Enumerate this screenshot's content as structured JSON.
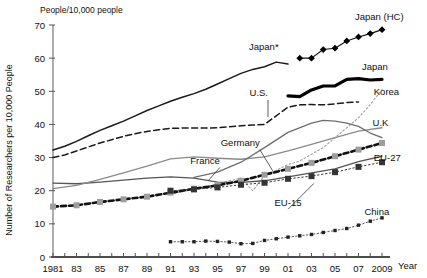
{
  "chart_data": {
    "type": "line",
    "title": "",
    "unit_label": "People/10,000 people",
    "ylabel": "Number of Researchers per 10,000 People",
    "xlabel": "Year",
    "xlim": [
      1981,
      2009
    ],
    "ylim": [
      0,
      70
    ],
    "yticks": [
      "0",
      "10",
      "20",
      "30",
      "40",
      "50",
      "60",
      "70"
    ],
    "ytick_values": [
      0,
      10,
      20,
      30,
      40,
      50,
      60,
      70
    ],
    "xticks": [
      "1981",
      "83",
      "85",
      "87",
      "89",
      "91",
      "93",
      "95",
      "97",
      "99",
      "01",
      "03",
      "05",
      "07",
      "2009"
    ],
    "xtick_values": [
      1981,
      1983,
      1985,
      1987,
      1989,
      1991,
      1993,
      1995,
      1997,
      1999,
      2001,
      2003,
      2005,
      2007,
      2009
    ],
    "grid": false,
    "legend_position": "inline-annotations",
    "series": [
      {
        "name": "Japan*",
        "label": "Japan*",
        "style": "solid-thin-black",
        "color": "#1a1a1a",
        "label_x": 2000.2,
        "label_y": 62.5,
        "x": [
          1981,
          1982,
          1983,
          1984,
          1985,
          1986,
          1987,
          1988,
          1989,
          1990,
          1991,
          1992,
          1993,
          1994,
          1995,
          1996,
          1997,
          1998,
          1999,
          2000,
          2001
        ],
        "y": [
          32.3,
          33.4,
          34.9,
          36.6,
          38.2,
          39.6,
          41.0,
          42.6,
          44.2,
          45.6,
          47.0,
          48.2,
          49.3,
          50.6,
          52.2,
          53.8,
          55.4,
          56.6,
          57.4,
          58.8,
          58.2
        ]
      },
      {
        "name": "U.S.",
        "label": "U.S.",
        "style": "dashed-thin-black",
        "color": "#1a1a1a",
        "label_x": 1999.3,
        "label_y": 48.5,
        "x": [
          1981,
          1982,
          1983,
          1984,
          1985,
          1986,
          1987,
          1988,
          1989,
          1990,
          1991,
          1992,
          1993,
          1994,
          1995,
          1996,
          1997,
          1998,
          1999,
          2000,
          2001,
          2002,
          2003,
          2004,
          2005,
          2006,
          2007
        ],
        "y": [
          30.0,
          30.8,
          32.0,
          33.2,
          34.4,
          35.4,
          36.4,
          37.2,
          37.9,
          38.4,
          38.8,
          38.9,
          38.9,
          38.9,
          39.0,
          39.3,
          39.6,
          39.8,
          40.0,
          42.6,
          45.2,
          45.9,
          46.0,
          45.9,
          46.2,
          46.6,
          46.8
        ]
      },
      {
        "name": "Japan",
        "label": "Japan",
        "style": "solid-thick-black",
        "color": "#000000",
        "label_x": 2007.3,
        "label_y": 56.5,
        "x": [
          2001,
          2002,
          2003,
          2004,
          2005,
          2006,
          2007,
          2008,
          2009
        ],
        "y": [
          48.6,
          48.4,
          50.4,
          51.6,
          51.6,
          53.6,
          53.8,
          53.4,
          53.6
        ]
      },
      {
        "name": "Japan (HC)",
        "label": "Japan (HC)",
        "style": "diamond-markers-black",
        "color": "#000000",
        "label_x": 2006.7,
        "label_y": 71.5,
        "x": [
          2002,
          2003,
          2004,
          2005,
          2006,
          2007,
          2008,
          2009
        ],
        "y": [
          60.0,
          60.0,
          62.6,
          63.0,
          65.2,
          66.4,
          67.4,
          68.6
        ]
      },
      {
        "name": "Korea",
        "label": "Korea",
        "style": "dotted-gray",
        "color": "#9a9a9a",
        "label_x": 2008.3,
        "label_y": 49.0,
        "x": [
          1991,
          1992,
          1993,
          1994,
          1995,
          1996,
          1997,
          1998,
          1999,
          2000,
          2001,
          2002,
          2003,
          2004,
          2005,
          2006,
          2007,
          2008,
          2009
        ],
        "y": [
          18.9,
          19.7,
          20.4,
          21.2,
          22.0,
          23.0,
          23.8,
          20.0,
          24.6,
          26.2,
          27.9,
          29.0,
          31.0,
          33.0,
          36.0,
          39.0,
          42.0,
          46.0,
          50.6
        ]
      },
      {
        "name": "Germany",
        "label": "Germany",
        "style": "solid-thin-gray-dark",
        "color": "#555555",
        "label_x": 1998.6,
        "label_y": 33.5,
        "x": [
          1981,
          1983,
          1985,
          1987,
          1989,
          1991,
          1993,
          1995,
          1997,
          1999,
          2001,
          2003,
          2005,
          2007,
          2009
        ],
        "y": [
          22.3,
          22.1,
          22.6,
          23.2,
          23.8,
          24.2,
          23.8,
          22.6,
          22.5,
          23.0,
          24.2,
          25.4,
          26.6,
          28.8,
          30.4
        ]
      },
      {
        "name": "France",
        "label": "France",
        "style": "solid-thin-gray",
        "color": "#8a8a8a",
        "label_x": 1995.2,
        "label_y": 28.0,
        "x": [
          1981,
          1983,
          1985,
          1987,
          1989,
          1991,
          1993,
          1995,
          1997,
          1999,
          2001,
          2003,
          2005,
          2007,
          2009
        ],
        "y": [
          20.6,
          21.6,
          23.4,
          25.4,
          27.4,
          29.6,
          30.2,
          29.8,
          29.5,
          30.2,
          32.0,
          34.0,
          36.0,
          38.0,
          39.0
        ]
      },
      {
        "name": "U.K",
        "label": "U.K",
        "style": "solid-thin-gray-uk",
        "color": "#6e6e6e",
        "label_x": 2008.2,
        "label_y": 39.5,
        "x": [
          1993,
          1995,
          1997,
          1999,
          2001,
          2003,
          2004,
          2005,
          2006,
          2007,
          2008,
          2009
        ],
        "y": [
          24.0,
          25.6,
          28.6,
          33.0,
          37.6,
          40.4,
          41.2,
          41.0,
          40.4,
          39.4,
          37.4,
          36.0
        ]
      },
      {
        "name": "EU-15",
        "label": "EU-15",
        "style": "dashed-thick-black-squares",
        "color": "#111111",
        "marker_color": "#999999",
        "label_x": 2001.0,
        "label_y": 15.5,
        "x": [
          1981,
          1983,
          1985,
          1987,
          1989,
          1991,
          1993,
          1995,
          1997,
          1999,
          2001,
          2003,
          2005,
          2007,
          2009
        ],
        "y": [
          15.2,
          15.6,
          16.6,
          17.4,
          18.2,
          19.4,
          20.6,
          21.6,
          23.0,
          24.8,
          26.6,
          28.4,
          30.4,
          32.4,
          34.4
        ]
      },
      {
        "name": "EU-27",
        "label": "EU-27",
        "style": "dotted-black-squares",
        "color": "#333333",
        "marker_color": "#3a3a3a",
        "label_x": 2008.3,
        "label_y": 29.0,
        "x": [
          1991,
          1993,
          1995,
          1997,
          1999,
          2001,
          2003,
          2005,
          2007,
          2009
        ],
        "y": [
          20.0,
          20.4,
          21.0,
          21.8,
          22.4,
          23.6,
          24.4,
          25.6,
          27.2,
          28.6
        ]
      },
      {
        "name": "China",
        "label": "China",
        "style": "dotted-small-black",
        "color": "#333333",
        "label_x": 2007.5,
        "label_y": 12.6,
        "x": [
          1991,
          1992,
          1993,
          1994,
          1995,
          1996,
          1997,
          1998,
          1999,
          2000,
          2001,
          2002,
          2003,
          2004,
          2005,
          2006,
          2007,
          2008,
          2009
        ],
        "y": [
          4.6,
          4.6,
          4.6,
          4.8,
          4.7,
          4.5,
          4.0,
          4.1,
          5.0,
          5.5,
          6.0,
          6.4,
          6.8,
          7.4,
          8.0,
          8.6,
          9.6,
          10.8,
          11.8
        ]
      }
    ]
  }
}
